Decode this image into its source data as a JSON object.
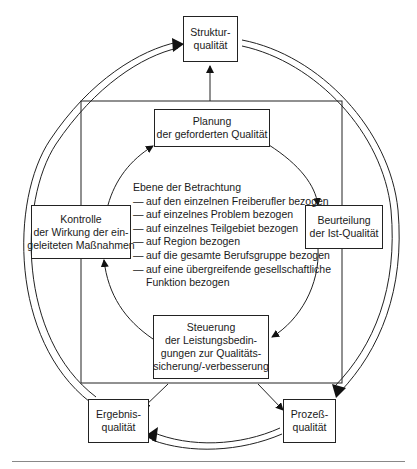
{
  "diagram": {
    "outer_nodes": {
      "struktur": [
        "Struktur-",
        "qualität"
      ],
      "ergebnis": [
        "Ergebnis-",
        "qualität"
      ],
      "prozess": [
        "Prozeß-",
        "qualität"
      ]
    },
    "inner_nodes": {
      "planung": [
        "Planung",
        "der geforderten Qualität"
      ],
      "beurteilung": [
        "Beurteilung",
        "der Ist-Qualität"
      ],
      "steuerung": [
        "Steuerung",
        "der Leistungsbedin-",
        "gungen zur Qualitäts-",
        "sicherung/-verbesserung"
      ],
      "kontrolle": [
        "Kontrolle",
        "der Wirkung der ein-",
        "geleiteten Maßnahmen"
      ]
    },
    "levels": {
      "title": "Ebene der Betrachtung",
      "items": [
        "auf den einzelnen Freiberufler bezogen",
        "auf einzelnes Problem bezogen",
        "auf einzelnes Teilgebiet bezogen",
        "auf Region bezogen",
        "auf die gesamte Berufsgruppe bezogen",
        "auf eine übergreifende gesellschaftliche"
      ],
      "continuation": "Funktion bezogen"
    },
    "edges": [
      {
        "from": "Planung",
        "to": "Beurteilung",
        "type": "inner-cycle"
      },
      {
        "from": "Beurteilung",
        "to": "Steuerung",
        "type": "inner-cycle"
      },
      {
        "from": "Steuerung",
        "to": "Kontrolle",
        "type": "inner-cycle"
      },
      {
        "from": "Kontrolle",
        "to": "Planung",
        "type": "inner-cycle"
      },
      {
        "from": "Inner square",
        "to": "Strukturqualität",
        "type": "single"
      },
      {
        "from": "Inner square",
        "to": "Ergebnisqualität",
        "type": "single"
      },
      {
        "from": "Inner square",
        "to": "Prozeßqualität",
        "type": "single"
      },
      {
        "from": "Strukturqualität",
        "to": "Prozeßqualität",
        "type": "double"
      },
      {
        "from": "Prozeßqualität",
        "to": "Ergebnisqualität",
        "type": "double"
      },
      {
        "from": "Ergebnisqualität",
        "to": "Strukturqualität",
        "type": "double"
      }
    ]
  }
}
